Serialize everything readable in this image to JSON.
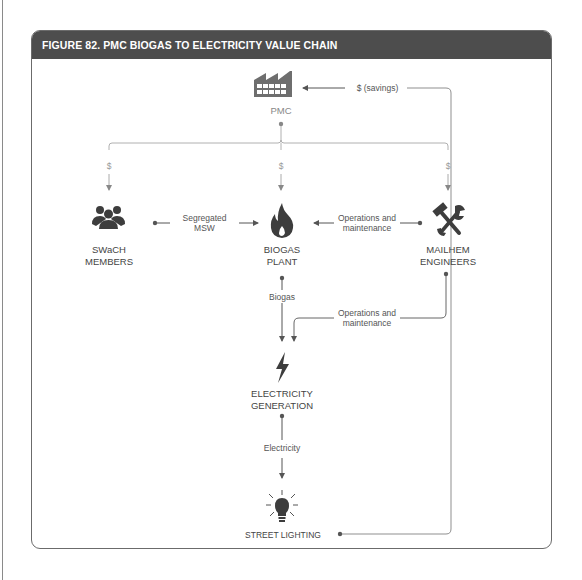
{
  "figure": {
    "title": "FIGURE 82.  PMC BIOGAS TO ELECTRICITY VALUE CHAIN"
  },
  "colors": {
    "header_bg": "#4d4d4d",
    "icon_dark": "#3d3d3d",
    "icon_gray": "#6e6e6e",
    "line": "#8f8f8f",
    "money_line": "#b0b0b0"
  },
  "nodes": {
    "pmc": {
      "label": "PMC",
      "icon": "factory-icon"
    },
    "swach": {
      "label_line1": "SWaCH",
      "label_line2": "MEMBERS",
      "icon": "people-group-icon"
    },
    "biogas_plant": {
      "label_line1": "BIOGAS",
      "label_line2": "PLANT",
      "icon": "flame-icon"
    },
    "mailhem": {
      "label_line1": "MAILHEM",
      "label_line2": "ENGINEERS",
      "icon": "tools-icon"
    },
    "electricity_generation": {
      "label_line1": "ELECTRICITY",
      "label_line2": "GENERATION",
      "icon": "lightning-bolt-icon"
    },
    "street_lighting": {
      "label": "STREET LIGHTING",
      "icon": "lightbulb-icon"
    }
  },
  "flows": {
    "savings": "$ (savings)",
    "pmc_to_swach": "$",
    "pmc_to_biogas": "$",
    "pmc_to_mailhem": "$",
    "msw_line1": "Segregated",
    "msw_line2": "MSW",
    "om_top_line1": "Operations and",
    "om_top_line2": "maintenance",
    "biogas": "Biogas",
    "om_bottom_line1": "Operations and",
    "om_bottom_line2": "maintenance",
    "electricity": "Electricity"
  }
}
